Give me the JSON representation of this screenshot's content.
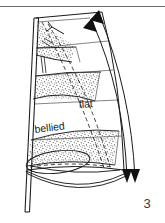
{
  "figure": {
    "number": "3",
    "background_color": "#ffffff",
    "ink_color": "#1a1a1a",
    "stipple_color": "#4a4a4a",
    "top_rule_color": "#6b6b6b"
  },
  "labels": {
    "flat": "flat",
    "bellied": "bellied"
  },
  "annotations": {
    "top_rule": "page-rule",
    "mast": "mast",
    "boom_ellipse": "boom-sweep-ellipse",
    "leech_curves": "leech-curve-lines",
    "arrow_up_outer": "arrow-up-outer",
    "arrow_up_inner": "arrow-up-inner",
    "arrow_down_outer": "arrow-down-outer",
    "arrow_down_inner": "arrow-down-inner",
    "arrow_small_head": "arrow-head-small",
    "panels": [
      "stipple-panel-top",
      "stipple-panel-middle",
      "stipple-panel-bottom"
    ],
    "dashed_outline": "flat-sail-dashed-outline",
    "solid_outline": "bellied-sail-solid-outline"
  }
}
